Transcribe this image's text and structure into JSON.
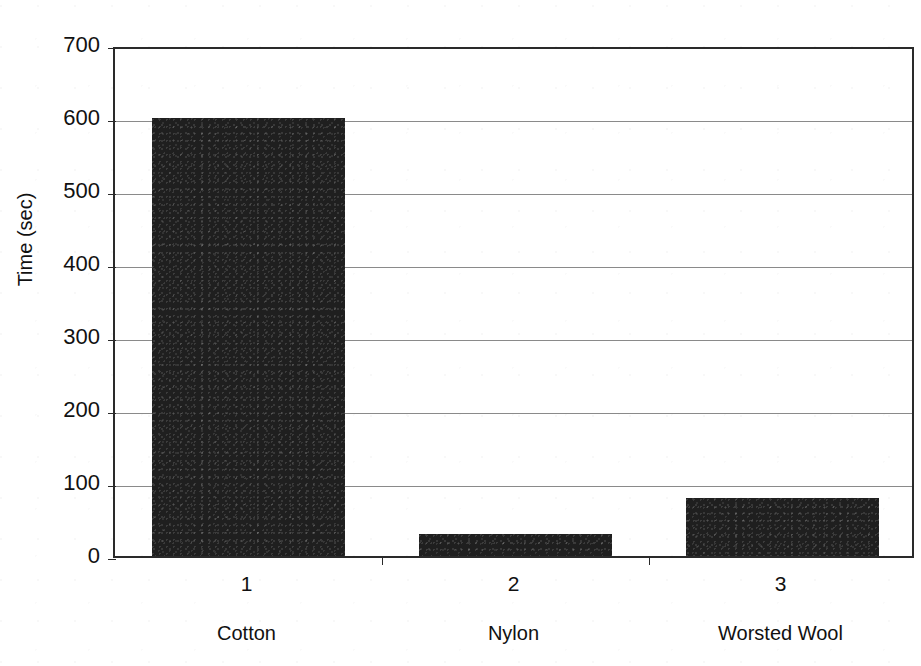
{
  "chart_data": {
    "type": "bar",
    "title": "",
    "xlabel": "",
    "ylabel": "Time (sec)",
    "categories": [
      "1",
      "2",
      "3"
    ],
    "category_names": [
      "Cotton",
      "Nylon",
      "Worsted Wool"
    ],
    "values": [
      600,
      30,
      80
    ],
    "ylim": [
      0,
      700
    ],
    "ytick_labels": [
      "0",
      "100",
      "200",
      "300",
      "400",
      "500",
      "600",
      "700"
    ],
    "ytick_values": [
      0,
      100,
      200,
      300,
      400,
      500,
      600,
      700
    ],
    "xtick_labels": [
      "1",
      "2",
      "3"
    ],
    "grid": true,
    "legend": false,
    "bar_color": "#1f1f1f",
    "gridline_color": "#8a8a8a",
    "axis_color": "#2a2a2a",
    "background_color": "#ffffff"
  },
  "axes": {
    "y_title": "Time (sec)"
  }
}
